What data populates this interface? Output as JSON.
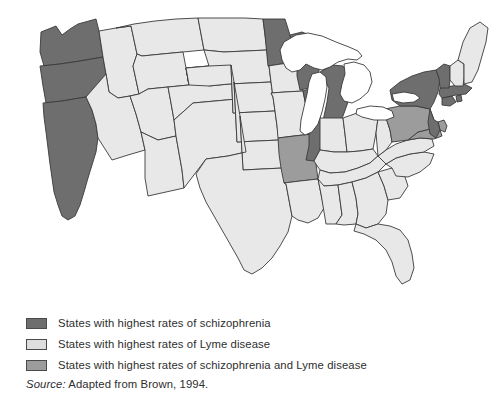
{
  "figure": {
    "kind": "thematic-choropleth-map",
    "region": "United States"
  },
  "legend": {
    "items": [
      {
        "id": "schizophrenia",
        "label": "States with highest rates of schizophrenia",
        "color": "#6e6e6e",
        "swatch_name": "legend-swatch-schizophrenia"
      },
      {
        "id": "lyme",
        "label": "States with highest rates of Lyme disease",
        "color": "#dedede",
        "swatch_name": "legend-swatch-lyme"
      },
      {
        "id": "both",
        "label": "States with highest rates of schizophrenia and Lyme disease",
        "color": "#9c9c9c",
        "swatch_name": "legend-swatch-both"
      }
    ]
  },
  "source": {
    "prefix": "Source:",
    "text": " Adapted from Brown, 1994."
  },
  "colors": {
    "schizophrenia": "#6e6e6e",
    "lyme": "#dedede",
    "both": "#9c9c9c",
    "unshaded": "#e8e8e8",
    "lake": "#ffffff",
    "border": "#3a3a3a",
    "text": "#2e2e2e",
    "background": "#ffffff"
  },
  "map_data": {
    "type": "choropleth",
    "title": "",
    "categories": [
      "schizophrenia",
      "lyme",
      "both",
      "unshaded"
    ],
    "states": [
      {
        "code": "WA",
        "name": "Washington",
        "category": "schizophrenia"
      },
      {
        "code": "OR",
        "name": "Oregon",
        "category": "schizophrenia"
      },
      {
        "code": "CA",
        "name": "California",
        "category": "schizophrenia"
      },
      {
        "code": "ID",
        "name": "Idaho",
        "category": "unshaded"
      },
      {
        "code": "NV",
        "name": "Nevada",
        "category": "unshaded"
      },
      {
        "code": "MT",
        "name": "Montana",
        "category": "unshaded"
      },
      {
        "code": "WY",
        "name": "Wyoming",
        "category": "unshaded"
      },
      {
        "code": "UT",
        "name": "Utah",
        "category": "unshaded"
      },
      {
        "code": "AZ",
        "name": "Arizona",
        "category": "unshaded"
      },
      {
        "code": "CO",
        "name": "Colorado",
        "category": "unshaded"
      },
      {
        "code": "NM",
        "name": "New Mexico",
        "category": "unshaded"
      },
      {
        "code": "ND",
        "name": "North Dakota",
        "category": "unshaded"
      },
      {
        "code": "SD",
        "name": "South Dakota",
        "category": "unshaded"
      },
      {
        "code": "NE",
        "name": "Nebraska",
        "category": "unshaded"
      },
      {
        "code": "KS",
        "name": "Kansas",
        "category": "unshaded"
      },
      {
        "code": "OK",
        "name": "Oklahoma",
        "category": "unshaded"
      },
      {
        "code": "TX",
        "name": "Texas",
        "category": "unshaded"
      },
      {
        "code": "MN",
        "name": "Minnesota",
        "category": "schizophrenia"
      },
      {
        "code": "IA",
        "name": "Iowa",
        "category": "unshaded"
      },
      {
        "code": "MO",
        "name": "Missouri",
        "category": "unshaded"
      },
      {
        "code": "AR",
        "name": "Arkansas",
        "category": "both"
      },
      {
        "code": "LA",
        "name": "Louisiana",
        "category": "unshaded"
      },
      {
        "code": "WI",
        "name": "Wisconsin",
        "category": "schizophrenia"
      },
      {
        "code": "IL",
        "name": "Illinois",
        "category": "schizophrenia"
      },
      {
        "code": "MI",
        "name": "Michigan",
        "category": "schizophrenia"
      },
      {
        "code": "IN",
        "name": "Indiana",
        "category": "unshaded"
      },
      {
        "code": "OH",
        "name": "Ohio",
        "category": "unshaded"
      },
      {
        "code": "KY",
        "name": "Kentucky",
        "category": "unshaded"
      },
      {
        "code": "TN",
        "name": "Tennessee",
        "category": "unshaded"
      },
      {
        "code": "MS",
        "name": "Mississippi",
        "category": "unshaded"
      },
      {
        "code": "AL",
        "name": "Alabama",
        "category": "unshaded"
      },
      {
        "code": "GA",
        "name": "Georgia",
        "category": "unshaded"
      },
      {
        "code": "FL",
        "name": "Florida",
        "category": "unshaded"
      },
      {
        "code": "SC",
        "name": "South Carolina",
        "category": "unshaded"
      },
      {
        "code": "NC",
        "name": "North Carolina",
        "category": "unshaded"
      },
      {
        "code": "VA",
        "name": "Virginia",
        "category": "unshaded"
      },
      {
        "code": "WV",
        "name": "West Virginia",
        "category": "unshaded"
      },
      {
        "code": "MD",
        "name": "Maryland",
        "category": "both"
      },
      {
        "code": "DE",
        "name": "Delaware",
        "category": "both"
      },
      {
        "code": "PA",
        "name": "Pennsylvania",
        "category": "both"
      },
      {
        "code": "NJ",
        "name": "New Jersey",
        "category": "schizophrenia"
      },
      {
        "code": "NY",
        "name": "New York",
        "category": "schizophrenia"
      },
      {
        "code": "CT",
        "name": "Connecticut",
        "category": "schizophrenia"
      },
      {
        "code": "RI",
        "name": "Rhode Island",
        "category": "schizophrenia"
      },
      {
        "code": "MA",
        "name": "Massachusetts",
        "category": "schizophrenia"
      },
      {
        "code": "VT",
        "name": "Vermont",
        "category": "schizophrenia"
      },
      {
        "code": "NH",
        "name": "New Hampshire",
        "category": "unshaded"
      },
      {
        "code": "ME",
        "name": "Maine",
        "category": "unshaded"
      }
    ],
    "lakes": [
      "Lake Superior",
      "Lake Michigan",
      "Lake Huron",
      "Lake Erie",
      "Lake Ontario"
    ]
  }
}
